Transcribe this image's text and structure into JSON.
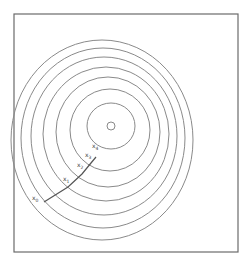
{
  "diagram": {
    "type": "contour-gradient-descent",
    "frame": {
      "x": 14,
      "y": 14,
      "width": 224,
      "height": 238
    },
    "center": {
      "x": 111,
      "y": 126
    },
    "contours": [
      {
        "rx": 4,
        "ry": 4,
        "dx": 0,
        "dy": 0
      },
      {
        "rx": 24,
        "ry": 23,
        "dx": 0,
        "dy": 0
      },
      {
        "rx": 40,
        "ry": 41,
        "dx": -1,
        "dy": 4
      },
      {
        "rx": 52,
        "ry": 55,
        "dx": -3,
        "dy": 6
      },
      {
        "rx": 63,
        "ry": 67,
        "dx": -5,
        "dy": 8
      },
      {
        "rx": 73,
        "ry": 79,
        "dx": -7,
        "dy": 10
      },
      {
        "rx": 82,
        "ry": 90,
        "dx": -8,
        "dy": 12
      },
      {
        "rx": 91,
        "ry": 100,
        "dx": -9,
        "dy": 14
      }
    ],
    "points": [
      {
        "label": "x",
        "sub": "0",
        "x": 44,
        "y": 202,
        "lx": 32,
        "ly": 200
      },
      {
        "label": "x",
        "sub": "1",
        "x": 68,
        "y": 187,
        "lx": 63,
        "ly": 181
      },
      {
        "label": "x",
        "sub": "2",
        "x": 82,
        "y": 174,
        "lx": 77,
        "ly": 167
      },
      {
        "label": "x",
        "sub": "3",
        "x": 91,
        "y": 163,
        "lx": 85,
        "ly": 157
      },
      {
        "label": "x",
        "sub": "4",
        "x": 96,
        "y": 157,
        "lx": 92,
        "ly": 148
      }
    ]
  }
}
